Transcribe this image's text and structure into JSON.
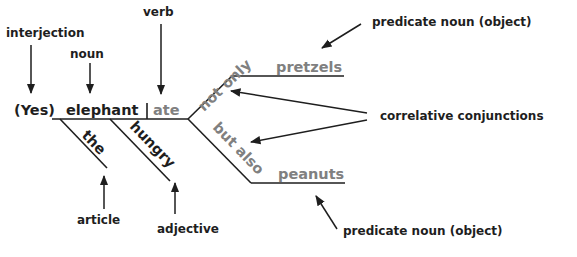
{
  "diagram": {
    "type": "sentence-diagram",
    "sentence_words": {
      "interjection": "(Yes)",
      "subject": "elephant",
      "verb": "ate",
      "article": "the",
      "adjective": "hungry",
      "conj_first": "not only",
      "conj_second": "but also",
      "object_first": "pretzels",
      "object_second": "peanuts"
    },
    "labels": {
      "interjection": "interjection",
      "noun": "noun",
      "verb": "verb",
      "article": "article",
      "adjective": "adjective",
      "predicate_noun_top": "predicate noun (object)",
      "predicate_noun_bottom": "predicate noun (object)",
      "correlative": "correlative conjunctions"
    },
    "colors": {
      "dark": "#1e1e1e",
      "gray": "#808080",
      "background": "#ffffff"
    }
  }
}
